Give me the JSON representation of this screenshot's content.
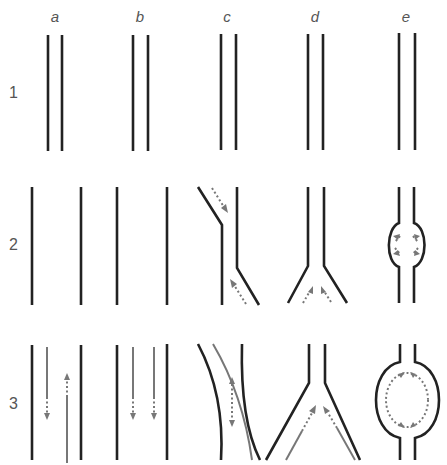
{
  "columns": [
    {
      "id": "a",
      "label": "a",
      "x": 55
    },
    {
      "id": "b",
      "label": "b",
      "x": 140
    },
    {
      "id": "c",
      "label": "c",
      "x": 227
    },
    {
      "id": "d",
      "label": "d",
      "x": 315
    },
    {
      "id": "e",
      "label": "e",
      "x": 406
    }
  ],
  "rows": [
    {
      "id": "1",
      "label": "1"
    },
    {
      "id": "2",
      "label": "2"
    },
    {
      "id": "3",
      "label": "3"
    }
  ],
  "colors": {
    "wall": "#222222",
    "flow": "#777777",
    "label": "#555555"
  }
}
